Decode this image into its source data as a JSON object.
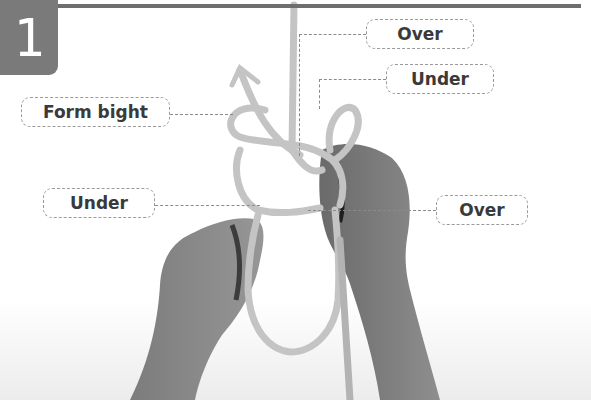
{
  "step": {
    "number": "1"
  },
  "labels": {
    "over_top": "Over",
    "under_top": "Under",
    "form_bight": "Form bight",
    "under_left": "Under",
    "over_right": "Over"
  },
  "colors": {
    "badge": "#7a7a7a",
    "rule": "#6e6e6e",
    "rope": "#bdbdbd",
    "skin": "#8a8a8a",
    "label_text": "#3a3a3a",
    "label_border": "#9a9a9a"
  }
}
